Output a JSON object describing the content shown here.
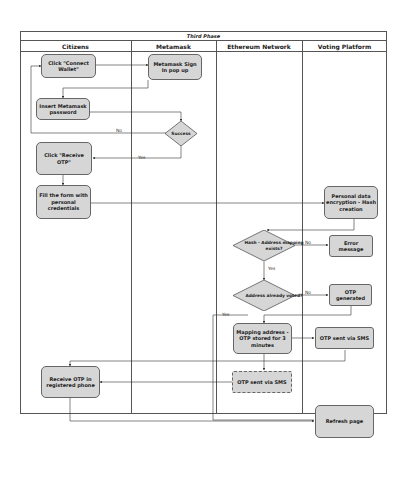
{
  "diagram": {
    "title": "Third Phase",
    "lanes": [
      "Citizens",
      "Metamask",
      "Ethereum Network",
      "Voting Platform"
    ],
    "nodes": {
      "connect_wallet": "Click \"Connect Wallet\"",
      "metamask_signin": "Metamask Sign In pop up",
      "insert_password": "Insert Metamask password",
      "success": "Success",
      "receive_otp_click": "Click \"Receive OTP\"",
      "fill_form": "Fill the form with personal credentials",
      "encryption": "Personal data encryption - Hash creation",
      "hash_exists": "Hash - Address mapping exists?",
      "error_message": "Error message",
      "already_voted": "Address already voted?",
      "otp_generated": "OTP generated",
      "mapping_stored": "Mapping address - OTP stored for 3 minutes",
      "otp_sent_platform": "OTP sent via SMS",
      "otp_sent_network": "OTP sent via SMS",
      "receive_otp_phone": "Receive OTP in registered phone",
      "refresh_page": "Refresh page"
    },
    "edge_labels": {
      "success_no": "No",
      "success_yes": "Yes",
      "hash_no": "No",
      "hash_yes": "Yes",
      "voted_no": "No",
      "voted_yes": "Yes"
    },
    "colors": {
      "node_fill": "#d6d6d6",
      "border": "#555555",
      "line": "#333333"
    }
  }
}
